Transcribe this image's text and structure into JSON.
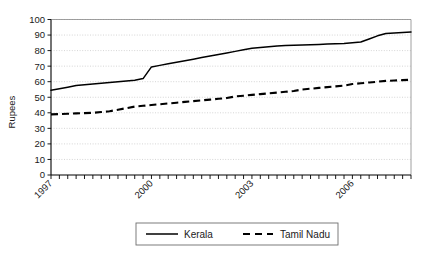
{
  "chart_data": {
    "type": "line",
    "title": "",
    "xlabel": "",
    "ylabel": "Rupees",
    "ylim": [
      0,
      100
    ],
    "ytick_step": 10,
    "yticks": [
      "0",
      "10",
      "20",
      "30",
      "40",
      "50",
      "60",
      "70",
      "80",
      "90",
      "100"
    ],
    "xticks_labeled": [
      "1997",
      "2000",
      "2003",
      "2006"
    ],
    "xlim": [
      1997,
      2007.75
    ],
    "x_tick_count": 44,
    "grid": "horizontal-dotted",
    "legend_position": "bottom-center",
    "x": [
      1997.0,
      1997.25,
      1997.5,
      1997.75,
      1998.0,
      1998.25,
      1998.5,
      1998.75,
      1999.0,
      1999.25,
      1999.5,
      1999.75,
      2000.0,
      2000.25,
      2000.5,
      2000.75,
      2001.0,
      2001.25,
      2001.5,
      2001.75,
      2002.0,
      2002.25,
      2002.5,
      2002.75,
      2003.0,
      2003.25,
      2003.5,
      2003.75,
      2004.0,
      2004.25,
      2004.5,
      2004.75,
      2005.0,
      2005.25,
      2005.5,
      2005.75,
      2006.0,
      2006.25,
      2006.5,
      2006.75,
      2007.0,
      2007.25,
      2007.5,
      2007.75
    ],
    "series": [
      {
        "name": "Kerala",
        "style": "solid",
        "color": "#000000",
        "values": [
          54.5,
          55.5,
          56.5,
          57.5,
          58.0,
          58.5,
          59.0,
          59.5,
          60.0,
          60.5,
          61.0,
          62.0,
          69.5,
          70.5,
          71.5,
          72.5,
          73.5,
          74.5,
          75.5,
          76.5,
          77.5,
          78.5,
          79.5,
          80.5,
          81.5,
          82.0,
          82.5,
          83.0,
          83.2,
          83.4,
          83.6,
          83.8,
          84.0,
          84.2,
          84.4,
          84.6,
          85.0,
          85.5,
          87.5,
          89.5,
          91.0,
          91.3,
          91.6,
          92.0
        ]
      },
      {
        "name": "Tamil Nadu",
        "style": "dashed",
        "color": "#000000",
        "values": [
          39.0,
          39.2,
          39.4,
          39.6,
          39.8,
          40.0,
          40.5,
          41.0,
          42.0,
          43.0,
          44.0,
          44.5,
          45.0,
          45.5,
          46.0,
          46.5,
          47.0,
          47.5,
          48.0,
          48.5,
          49.0,
          49.5,
          50.5,
          51.0,
          51.5,
          52.0,
          52.5,
          53.0,
          53.5,
          54.0,
          55.0,
          55.5,
          56.0,
          56.5,
          57.0,
          57.5,
          58.5,
          59.0,
          59.5,
          60.0,
          60.5,
          60.8,
          61.0,
          61.3
        ]
      }
    ]
  },
  "legend": {
    "items": [
      {
        "label": "Kerala",
        "style": "solid"
      },
      {
        "label": "Tamil Nadu",
        "style": "dashed"
      }
    ]
  },
  "axes": {
    "y_title": "Rupees"
  }
}
